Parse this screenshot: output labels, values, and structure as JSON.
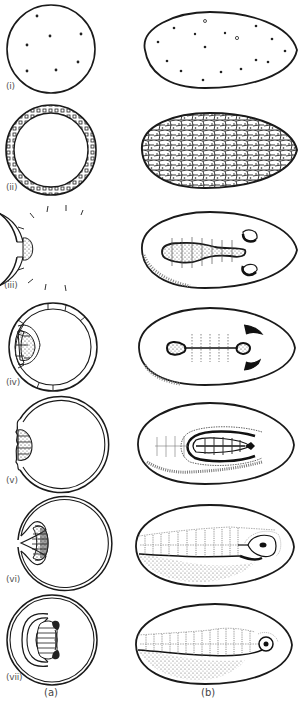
{
  "figure": {
    "columns": [
      {
        "id": "a",
        "label": "(a)",
        "description": "sectional view"
      },
      {
        "id": "b",
        "label": "(b)",
        "description": "surface view"
      }
    ],
    "stages": [
      {
        "label": "(i)",
        "a": "egg with scattered nuclei (circle)",
        "b": "ovoid egg with scattered nuclei"
      },
      {
        "label": "(ii)",
        "a": "blastoderm ring of cells",
        "b": "egg surface covered by polygonal blastoderm cells"
      },
      {
        "label": "(iii)",
        "a": "germ band thickening on left side",
        "b": "germ band with segmentation lines and paired head lobes"
      },
      {
        "label": "(iv)",
        "a": "germ band thickened, indented",
        "b": "narrowed germ band with two end swellings and crescent lobes"
      },
      {
        "label": "(v)",
        "a": "germ band sinking with folds",
        "b": "germ band folded, amnion folds surrounding"
      },
      {
        "label": "(vi)",
        "a": "germ band invaginated into yolk",
        "b": "elongated segmented embryo with head capsule"
      },
      {
        "label": "(vii)",
        "a": "embryo enclosed by amnion inside egg",
        "b": "fully segmented embryo along egg length"
      }
    ]
  }
}
